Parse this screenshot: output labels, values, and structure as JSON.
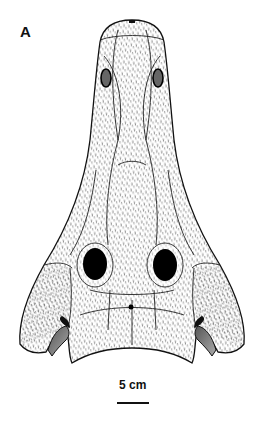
{
  "figure": {
    "panel_label": "A",
    "scale_bar": {
      "label": "5 cm"
    },
    "colors": {
      "ink": "#111111",
      "background": "#ffffff",
      "shade": "#777777"
    }
  }
}
